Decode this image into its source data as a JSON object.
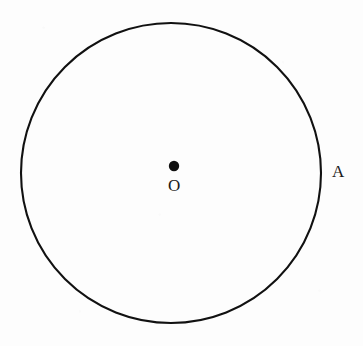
{
  "figure": {
    "type": "geometry-diagram",
    "background_color": "#fdfdfd",
    "stroke_color": "#111111",
    "text_color": "#1a1a1a",
    "canvas": {
      "width": 363,
      "height": 346
    }
  },
  "shapes": {
    "circle": {
      "name": "circle",
      "center_x": 171,
      "center_y": 173,
      "radius": 150,
      "stroke_width": 2.1,
      "fill": "none"
    },
    "center_dot": {
      "name": "center-point",
      "cx": 174,
      "cy": 166,
      "r": 5.2,
      "fill": "#111111"
    }
  },
  "labels": {
    "center": {
      "text": "O",
      "x": 176,
      "y": 187
    },
    "point_a": {
      "text": "A",
      "x": 339,
      "y": 172
    }
  }
}
